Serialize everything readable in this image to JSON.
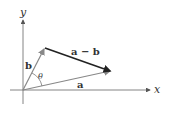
{
  "diagram": {
    "axes": {
      "x_label": "x",
      "y_label": "y"
    },
    "vectors": {
      "a": {
        "label": "a",
        "color": "#888888"
      },
      "b": {
        "label": "b",
        "color": "#888888"
      },
      "a_minus_b": {
        "label": "a − b",
        "color": "#222222"
      }
    },
    "angle_label": "θ"
  }
}
